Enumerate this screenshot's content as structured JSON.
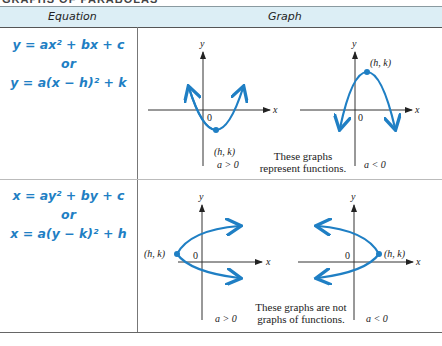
{
  "page_title_cut": "GRAPHS OF PARABOLAS",
  "table": {
    "headers": {
      "equation": "Equation",
      "graph": "Graph"
    },
    "rows": [
      {
        "equations": [
          "y = ax² + bx + c",
          "or",
          "y = a(x − h)² + k"
        ],
        "note": [
          "These graphs",
          "represent functions."
        ],
        "graphs": [
          {
            "vertex_label": "(h, k)",
            "condition": "a > 0",
            "opens": "up"
          },
          {
            "vertex_label": "(h, k)",
            "condition": "a < 0",
            "opens": "down"
          }
        ]
      },
      {
        "equations": [
          "x = ay² + by + c",
          "or",
          "x = a(y − k)² + h"
        ],
        "note": [
          "These graphs are not",
          "graphs of functions."
        ],
        "graphs": [
          {
            "vertex_label": "(h, k)",
            "condition": "a > 0",
            "opens": "right"
          },
          {
            "vertex_label": "(h, k)",
            "condition": "a < 0",
            "opens": "left"
          }
        ]
      }
    ]
  },
  "axis": {
    "x": "x",
    "y": "y",
    "origin": "0"
  },
  "colors": {
    "curve": "#1f7fc4",
    "header_bg": "#dceef5",
    "equation": "#1f7fc4"
  }
}
